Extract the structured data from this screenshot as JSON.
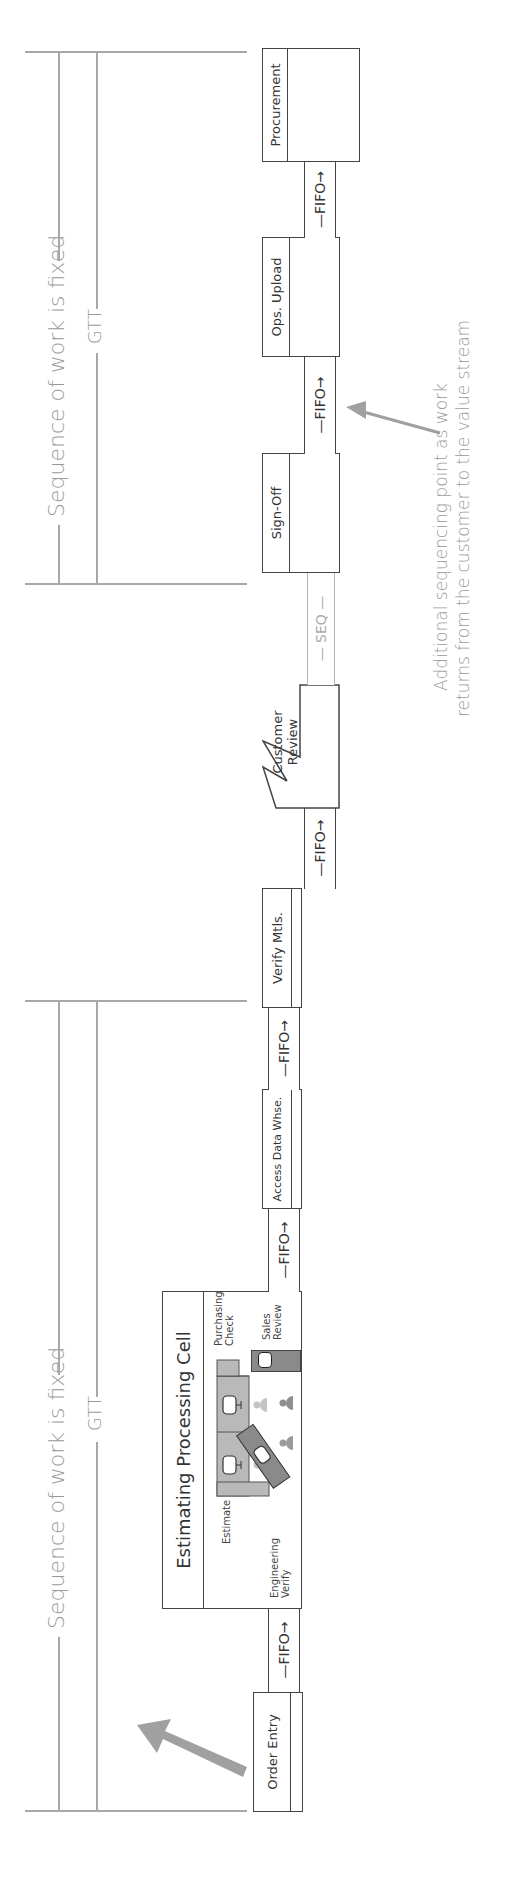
{
  "diagram": {
    "type": "value-stream-map",
    "orientation": "rotated-90-ccw",
    "colors": {
      "line": "#a8a8a8",
      "box_border": "#444444",
      "annotation_text": "#9a9a9a",
      "arrow": "#a0a0a0",
      "workstation_light": "#b9b9b9",
      "workstation_dark": "#8a8a8a",
      "person_light": "#c4c4c4",
      "person_dark": "#8f8f8f"
    }
  },
  "brackets": [
    {
      "label_top": "Sequence of work is fixed",
      "label_bottom": "GTT"
    },
    {
      "label_top": "Sequence of work is fixed",
      "label_bottom": "GTT"
    }
  ],
  "processes": {
    "order_entry": "Order Entry",
    "cell_title": "Estimating Processing Cell",
    "cell_stations": {
      "estimate": "Estimate",
      "engineering": [
        "Engineering",
        "Verify"
      ],
      "purchasing": [
        "Purchasing",
        "Check"
      ],
      "sales": [
        "Sales",
        "Review"
      ]
    },
    "access_data": "Access Data Whse.",
    "verify_mtls": "Verify Mtls.",
    "customer_review": [
      "Customer",
      "Review"
    ],
    "sign_off": "Sign-Off",
    "ops_upload": "Ops. Upload",
    "procurement": "Procurement"
  },
  "connectors": {
    "fifo": "—FIFO→",
    "seq": "— SEQ —"
  },
  "annotation": {
    "line1": "Additional sequencing point as work",
    "line2": "returns from the customer to the value stream"
  }
}
